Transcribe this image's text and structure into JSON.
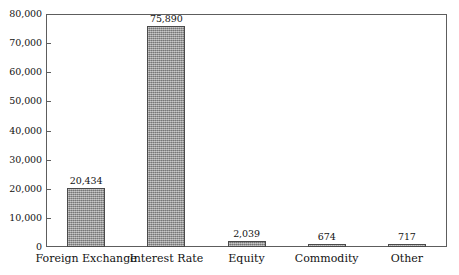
{
  "figure": {
    "title_remnant": "",
    "background_color": "#ffffff",
    "bar_fill_color": "#9a9a9a",
    "bar_border_color": "#4a4a4a",
    "axis_color": "#5d5d5d",
    "text_color": "#131313"
  },
  "chart_data": {
    "type": "bar",
    "title": "",
    "xlabel": "",
    "ylabel": "",
    "ylim": [
      0,
      80000
    ],
    "grid": false,
    "legend": "none",
    "categories": [
      "Foreign Exchange",
      "Interest Rate",
      "Equity",
      "Commodity",
      "Other"
    ],
    "values": [
      20434,
      75890,
      2039,
      674,
      717
    ],
    "value_labels": [
      "20,434",
      "75,890",
      "2,039",
      "674",
      "717"
    ],
    "ytick_values": [
      0,
      10000,
      20000,
      30000,
      40000,
      50000,
      60000,
      70000,
      80000
    ],
    "ytick_labels": [
      "0",
      "10,000",
      "20,000",
      "30,000",
      "40,000",
      "50,000",
      "60,000",
      "70,000",
      "80,000"
    ]
  }
}
